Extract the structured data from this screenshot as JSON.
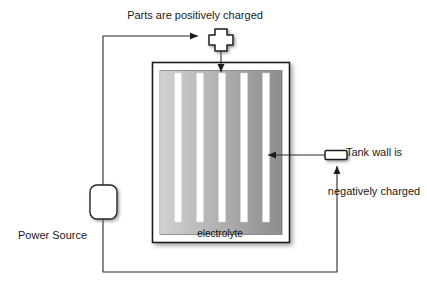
{
  "diagram": {
    "title_top": "Parts are positively charged",
    "label_right_line1": "Tank wall is",
    "label_right_line2": "negatively charged",
    "label_power_source": "Power Source",
    "label_electrolyte": "electrolyte",
    "symbols": {
      "positive": "plus-symbol",
      "negative": "minus-symbol"
    },
    "colors": {
      "stroke": "#2b2b2b",
      "text": "#1a1a1a",
      "electrolyte_light": "#c9c9c9",
      "electrolyte_dark": "#8f8f8f",
      "part_fill": "#ffffff",
      "tank_border": "#1e1e1e",
      "background": "#ffffff"
    },
    "parts_count": 5
  }
}
